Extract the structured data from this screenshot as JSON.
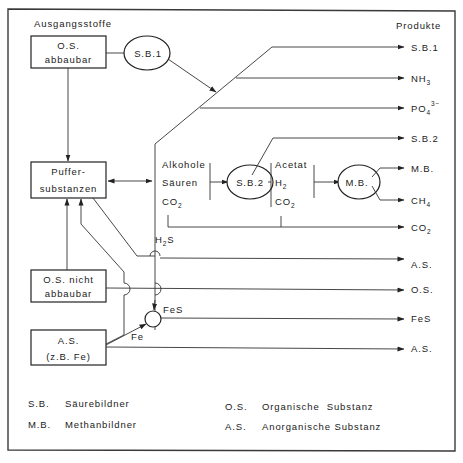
{
  "diagram": {
    "headers": {
      "inputs": "Ausgangsstoffe",
      "outputs": "Produkte"
    },
    "source_boxes": {
      "os_degradable": {
        "line1": "O.S.",
        "line2": "abbaubar"
      },
      "buffer": {
        "line1": "Puffer-",
        "line2": "substanzen"
      },
      "os_nondegradable": {
        "line1": "O.S. nicht",
        "line2": "abbaubar"
      },
      "inorganic": {
        "line1": "A.S.",
        "line2": "(z.B. Fe)"
      }
    },
    "organisms": {
      "sb1": "S.B.1",
      "sb2": "S.B.2",
      "mb": "M.B."
    },
    "intermediates": {
      "group1": {
        "a": "Alkohole",
        "b": "Säuren",
        "c_base": "CO",
        "c_sub": "2"
      },
      "group2": {
        "a": "Acetat",
        "b_base": "H",
        "b_sub": "2",
        "c_base": "CO",
        "c_sub": "2"
      },
      "h2s_base": "H",
      "h2s_sub": "2",
      "h2s_end": "S",
      "fes": "FeS",
      "fe": "Fe"
    },
    "products": {
      "p1": "S.B.1",
      "p2_base": "NH",
      "p2_sub": "3",
      "p3_base": "PO",
      "p3_sub": "4",
      "p3_sup": "3−",
      "p4": "S.B.2",
      "p5": "M.B.",
      "p6_base": "CH",
      "p6_sub": "4",
      "p7_base": "CO",
      "p7_sub": "2",
      "p8": "A.S.",
      "p9": "O.S.",
      "p10": "FeS",
      "p11": "A.S."
    },
    "legend": [
      {
        "abbr": "S.B.",
        "text": "Säurebildner"
      },
      {
        "abbr": "M.B.",
        "text": "Methanbildner"
      },
      {
        "abbr": "O.S.",
        "text": "Organische  Substanz"
      },
      {
        "abbr": "A.S.",
        "text": "Anorganische Substanz"
      }
    ]
  }
}
